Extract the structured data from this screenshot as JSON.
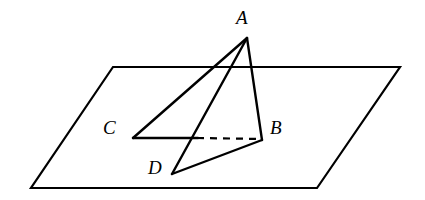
{
  "figure": {
    "kind": "solid-geometry-diagram",
    "background_color": "#ffffff",
    "stroke_color": "#000000",
    "stroke_width": 2.2,
    "plane": {
      "name": "plane",
      "points": "113,67 400,67 317,188 31,188",
      "corners": [
        {
          "name": "plane-corner-top-left",
          "x": 113,
          "y": 67
        },
        {
          "name": "plane-corner-top-right",
          "x": 400,
          "y": 67
        },
        {
          "name": "plane-corner-bottom-right",
          "x": 317,
          "y": 188
        },
        {
          "name": "plane-corner-bottom-left",
          "x": 31,
          "y": 188
        }
      ]
    },
    "vertices": [
      {
        "id": "A",
        "label": "A",
        "x": 247,
        "y": 38,
        "label_x": 236,
        "label_y": 8
      },
      {
        "id": "B",
        "label": "B",
        "x": 262,
        "y": 140,
        "label_x": 270,
        "label_y": 118
      },
      {
        "id": "C",
        "label": "C",
        "x": 133,
        "y": 138,
        "label_x": 103,
        "label_y": 118
      },
      {
        "id": "D",
        "label": "D",
        "x": 172,
        "y": 174,
        "label_x": 148,
        "label_y": 158
      }
    ],
    "edges": [
      {
        "id": "AC",
        "from": "A",
        "to": "C",
        "style": "solid",
        "x1": 247,
        "y1": 38,
        "x2": 133,
        "y2": 138
      },
      {
        "id": "AD",
        "from": "A",
        "to": "D",
        "style": "solid",
        "x1": 247,
        "y1": 38,
        "x2": 172,
        "y2": 174
      },
      {
        "id": "AB",
        "from": "A",
        "to": "B",
        "style": "solid",
        "x1": 247,
        "y1": 38,
        "x2": 262,
        "y2": 140
      },
      {
        "id": "DB",
        "from": "D",
        "to": "B",
        "style": "solid",
        "x1": 172,
        "y1": 174,
        "x2": 262,
        "y2": 140
      },
      {
        "id": "C-to-crossing",
        "from": "C",
        "to": "crossing",
        "style": "solid",
        "x1": 133,
        "y1": 138,
        "x2": 196,
        "y2": 138
      },
      {
        "id": "crossing-to-B",
        "from": "crossing",
        "to": "B",
        "style": "dashed",
        "x1": 196,
        "y1": 138,
        "x2": 261,
        "y2": 139,
        "dash": "7,6"
      }
    ]
  }
}
